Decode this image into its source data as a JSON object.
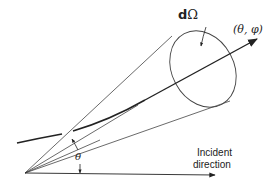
{
  "diagram": {
    "labels": {
      "solid_angle_prefix": "d",
      "solid_angle_symbol": "Ω",
      "scattered_direction": "(θ, φ)",
      "angle": "θ",
      "incident_line1": "Incident",
      "incident_line2": "direction"
    },
    "colors": {
      "line": "#333333",
      "background": "#ffffff"
    }
  }
}
